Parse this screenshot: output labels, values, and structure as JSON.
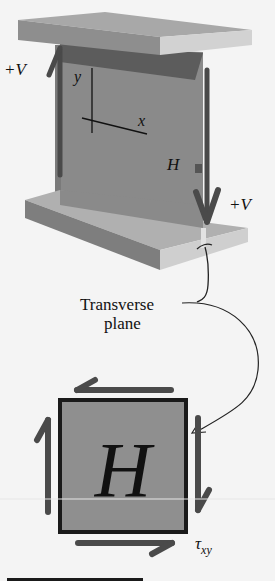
{
  "diagram": {
    "type": "shear-stress-element",
    "beam_labels": {
      "shear_left": "+V",
      "shear_right": "+V",
      "axis_y": "y",
      "axis_x": "x",
      "point": "H"
    },
    "callout": {
      "line1": "Transverse",
      "line2": "plane"
    },
    "element": {
      "label": "H",
      "stress_label_main": "τ",
      "stress_label_sub": "xy"
    },
    "colors": {
      "background": "#f4f4f4",
      "web": "#8a8a8a",
      "flange_top": "#a5a5a5",
      "flange_side": "#7e7e7e",
      "flange_light": "#c9c9c9",
      "arrow": "#4a4a4a",
      "element_fill": "#8f8f8f",
      "element_border": "#1a1a1a"
    }
  }
}
